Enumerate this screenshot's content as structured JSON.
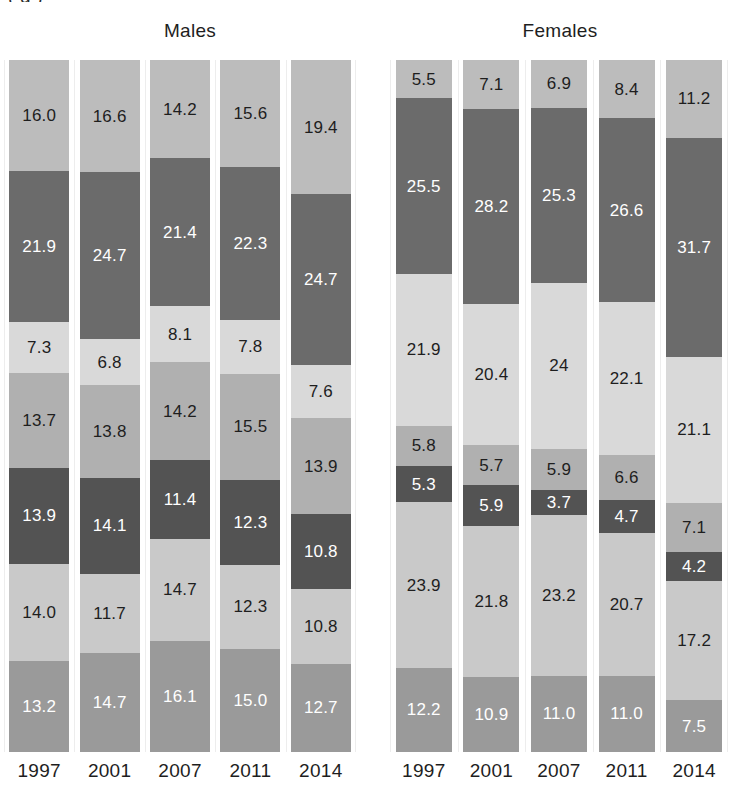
{
  "caption": {
    "clipped_top_text": "(            g                                    )"
  },
  "panels": [
    {
      "key": "males",
      "title": "Males"
    },
    {
      "key": "females",
      "title": "Females"
    }
  ],
  "axis": {
    "years": [
      "1997",
      "2001",
      "2007",
      "2011",
      "2014"
    ]
  },
  "palette": {
    "s1": "#bcbcbc",
    "s2": "#6b6b6b",
    "s3": "#d9d9d9",
    "s4": "#b0b0b0",
    "s5": "#535353",
    "s6": "#c9c9c9",
    "s7": "#9a9a9a",
    "label_dark": "#1e1e1e",
    "label_light": "#ffffff"
  },
  "chart_data": {
    "type": "bar",
    "subtype": "stacked-100-percent",
    "orientation": "vertical",
    "title": "",
    "xlabel": "",
    "ylabel": "",
    "ylim": [
      0,
      100
    ],
    "grid": false,
    "legend": "none",
    "categories": [
      "1997",
      "2001",
      "2007",
      "2011",
      "2014"
    ],
    "segment_order_top_to_bottom": [
      "s1",
      "s2",
      "s3",
      "s4",
      "s5",
      "s6",
      "s7"
    ],
    "panels": [
      {
        "name": "Males",
        "bars": [
          {
            "category": "1997",
            "segments": [
              {
                "key": "s1",
                "value": "16.0",
                "color": "#bcbcbc",
                "text": "#1e1e1e"
              },
              {
                "key": "s2",
                "value": "21.9",
                "color": "#6b6b6b",
                "text": "#ffffff"
              },
              {
                "key": "s3",
                "value": "7.3",
                "color": "#d9d9d9",
                "text": "#1e1e1e"
              },
              {
                "key": "s4",
                "value": "13.7",
                "color": "#b0b0b0",
                "text": "#1e1e1e"
              },
              {
                "key": "s5",
                "value": "13.9",
                "color": "#535353",
                "text": "#ffffff"
              },
              {
                "key": "s6",
                "value": "14.0",
                "color": "#c9c9c9",
                "text": "#1e1e1e"
              },
              {
                "key": "s7",
                "value": "13.2",
                "color": "#9a9a9a",
                "text": "#ffffff"
              }
            ]
          },
          {
            "category": "2001",
            "segments": [
              {
                "key": "s1",
                "value": "16.6",
                "color": "#bcbcbc",
                "text": "#1e1e1e"
              },
              {
                "key": "s2",
                "value": "24.7",
                "color": "#6b6b6b",
                "text": "#ffffff"
              },
              {
                "key": "s3",
                "value": "6.8",
                "color": "#d9d9d9",
                "text": "#1e1e1e"
              },
              {
                "key": "s4",
                "value": "13.8",
                "color": "#b0b0b0",
                "text": "#1e1e1e"
              },
              {
                "key": "s5",
                "value": "14.1",
                "color": "#535353",
                "text": "#ffffff"
              },
              {
                "key": "s6",
                "value": "11.7",
                "color": "#c9c9c9",
                "text": "#1e1e1e"
              },
              {
                "key": "s7",
                "value": "14.7",
                "color": "#9a9a9a",
                "text": "#ffffff"
              }
            ]
          },
          {
            "category": "2007",
            "segments": [
              {
                "key": "s1",
                "value": "14.2",
                "color": "#bcbcbc",
                "text": "#1e1e1e"
              },
              {
                "key": "s2",
                "value": "21.4",
                "color": "#6b6b6b",
                "text": "#ffffff"
              },
              {
                "key": "s3",
                "value": "8.1",
                "color": "#d9d9d9",
                "text": "#1e1e1e"
              },
              {
                "key": "s4",
                "value": "14.2",
                "color": "#b0b0b0",
                "text": "#1e1e1e"
              },
              {
                "key": "s5",
                "value": "11.4",
                "color": "#535353",
                "text": "#ffffff"
              },
              {
                "key": "s6",
                "value": "14.7",
                "color": "#c9c9c9",
                "text": "#1e1e1e"
              },
              {
                "key": "s7",
                "value": "16.1",
                "color": "#9a9a9a",
                "text": "#ffffff"
              }
            ]
          },
          {
            "category": "2011",
            "segments": [
              {
                "key": "s1",
                "value": "15.6",
                "color": "#bcbcbc",
                "text": "#1e1e1e"
              },
              {
                "key": "s2",
                "value": "22.3",
                "color": "#6b6b6b",
                "text": "#ffffff"
              },
              {
                "key": "s3",
                "value": "7.8",
                "color": "#d9d9d9",
                "text": "#1e1e1e"
              },
              {
                "key": "s4",
                "value": "15.5",
                "color": "#b0b0b0",
                "text": "#1e1e1e"
              },
              {
                "key": "s5",
                "value": "12.3",
                "color": "#535353",
                "text": "#ffffff"
              },
              {
                "key": "s6",
                "value": "12.3",
                "color": "#c9c9c9",
                "text": "#1e1e1e"
              },
              {
                "key": "s7",
                "value": "15.0",
                "color": "#9a9a9a",
                "text": "#ffffff"
              }
            ]
          },
          {
            "category": "2014",
            "segments": [
              {
                "key": "s1",
                "value": "19.4",
                "color": "#bcbcbc",
                "text": "#1e1e1e"
              },
              {
                "key": "s2",
                "value": "24.7",
                "color": "#6b6b6b",
                "text": "#ffffff"
              },
              {
                "key": "s3",
                "value": "7.6",
                "color": "#d9d9d9",
                "text": "#1e1e1e"
              },
              {
                "key": "s4",
                "value": "13.9",
                "color": "#b0b0b0",
                "text": "#1e1e1e"
              },
              {
                "key": "s5",
                "value": "10.8",
                "color": "#535353",
                "text": "#ffffff"
              },
              {
                "key": "s6",
                "value": "10.8",
                "color": "#c9c9c9",
                "text": "#1e1e1e"
              },
              {
                "key": "s7",
                "value": "12.7",
                "color": "#9a9a9a",
                "text": "#ffffff"
              }
            ]
          }
        ]
      },
      {
        "name": "Females",
        "bars": [
          {
            "category": "1997",
            "segments": [
              {
                "key": "s1",
                "value": "5.5",
                "color": "#bcbcbc",
                "text": "#1e1e1e"
              },
              {
                "key": "s2",
                "value": "25.5",
                "color": "#6b6b6b",
                "text": "#ffffff"
              },
              {
                "key": "s3",
                "value": "21.9",
                "color": "#d9d9d9",
                "text": "#1e1e1e"
              },
              {
                "key": "s4",
                "value": "5.8",
                "color": "#b0b0b0",
                "text": "#1e1e1e"
              },
              {
                "key": "s5",
                "value": "5.3",
                "color": "#535353",
                "text": "#ffffff"
              },
              {
                "key": "s6",
                "value": "23.9",
                "color": "#c9c9c9",
                "text": "#1e1e1e"
              },
              {
                "key": "s7",
                "value": "12.2",
                "color": "#9a9a9a",
                "text": "#ffffff"
              }
            ]
          },
          {
            "category": "2001",
            "segments": [
              {
                "key": "s1",
                "value": "7.1",
                "color": "#bcbcbc",
                "text": "#1e1e1e"
              },
              {
                "key": "s2",
                "value": "28.2",
                "color": "#6b6b6b",
                "text": "#ffffff"
              },
              {
                "key": "s3",
                "value": "20.4",
                "color": "#d9d9d9",
                "text": "#1e1e1e"
              },
              {
                "key": "s4",
                "value": "5.7",
                "color": "#b0b0b0",
                "text": "#1e1e1e"
              },
              {
                "key": "s5",
                "value": "5.9",
                "color": "#535353",
                "text": "#ffffff"
              },
              {
                "key": "s6",
                "value": "21.8",
                "color": "#c9c9c9",
                "text": "#1e1e1e"
              },
              {
                "key": "s7",
                "value": "10.9",
                "color": "#9a9a9a",
                "text": "#ffffff"
              }
            ]
          },
          {
            "category": "2007",
            "segments": [
              {
                "key": "s1",
                "value": "6.9",
                "color": "#bcbcbc",
                "text": "#1e1e1e"
              },
              {
                "key": "s2",
                "value": "25.3",
                "color": "#6b6b6b",
                "text": "#ffffff"
              },
              {
                "key": "s3",
                "value": "24",
                "color": "#d9d9d9",
                "text": "#1e1e1e"
              },
              {
                "key": "s4",
                "value": "5.9",
                "color": "#b0b0b0",
                "text": "#1e1e1e"
              },
              {
                "key": "s5",
                "value": "3.7",
                "color": "#535353",
                "text": "#ffffff"
              },
              {
                "key": "s6",
                "value": "23.2",
                "color": "#c9c9c9",
                "text": "#1e1e1e"
              },
              {
                "key": "s7",
                "value": "11.0",
                "color": "#9a9a9a",
                "text": "#ffffff"
              }
            ]
          },
          {
            "category": "2011",
            "segments": [
              {
                "key": "s1",
                "value": "8.4",
                "color": "#bcbcbc",
                "text": "#1e1e1e"
              },
              {
                "key": "s2",
                "value": "26.6",
                "color": "#6b6b6b",
                "text": "#ffffff"
              },
              {
                "key": "s3",
                "value": "22.1",
                "color": "#d9d9d9",
                "text": "#1e1e1e"
              },
              {
                "key": "s4",
                "value": "6.6",
                "color": "#b0b0b0",
                "text": "#1e1e1e"
              },
              {
                "key": "s5",
                "value": "4.7",
                "color": "#535353",
                "text": "#ffffff"
              },
              {
                "key": "s6",
                "value": "20.7",
                "color": "#c9c9c9",
                "text": "#1e1e1e"
              },
              {
                "key": "s7",
                "value": "11.0",
                "color": "#9a9a9a",
                "text": "#ffffff"
              }
            ]
          },
          {
            "category": "2014",
            "segments": [
              {
                "key": "s1",
                "value": "11.2",
                "color": "#bcbcbc",
                "text": "#1e1e1e"
              },
              {
                "key": "s2",
                "value": "31.7",
                "color": "#6b6b6b",
                "text": "#ffffff"
              },
              {
                "key": "s3",
                "value": "21.1",
                "color": "#d9d9d9",
                "text": "#1e1e1e"
              },
              {
                "key": "s4",
                "value": "7.1",
                "color": "#b0b0b0",
                "text": "#1e1e1e"
              },
              {
                "key": "s5",
                "value": "4.2",
                "color": "#535353",
                "text": "#ffffff"
              },
              {
                "key": "s6",
                "value": "17.2",
                "color": "#c9c9c9",
                "text": "#1e1e1e"
              },
              {
                "key": "s7",
                "value": "7.5",
                "color": "#9a9a9a",
                "text": "#ffffff"
              }
            ]
          }
        ]
      }
    ]
  }
}
